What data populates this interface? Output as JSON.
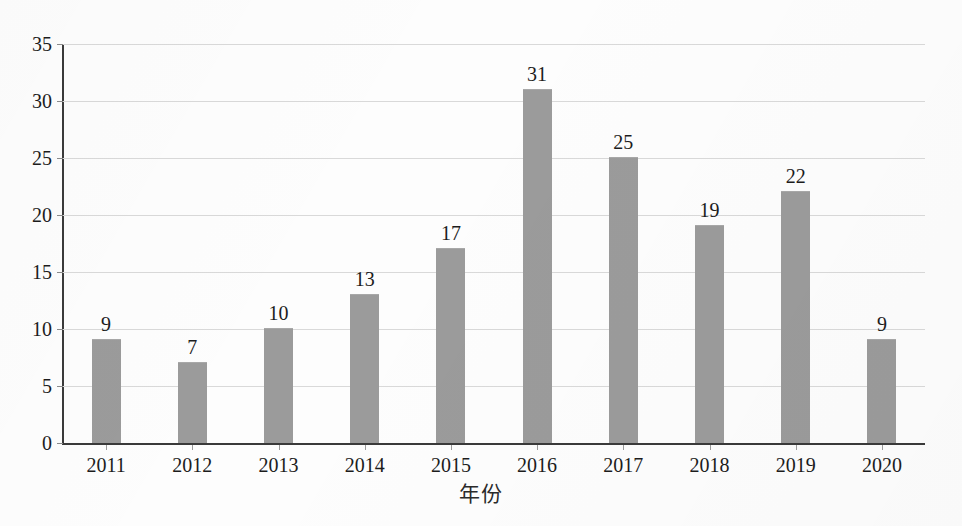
{
  "chart_data": {
    "type": "bar",
    "title": "",
    "subtitle": "",
    "xlabel": "年份",
    "ylabel": "",
    "categories": [
      "2011",
      "2012",
      "2013",
      "2014",
      "2015",
      "2016",
      "2017",
      "2018",
      "2019",
      "2020"
    ],
    "values": [
      9,
      7,
      10,
      13,
      17,
      31,
      25,
      19,
      22,
      9
    ],
    "data_labels": [
      "9",
      "7",
      "10",
      "13",
      "17",
      "31",
      "25",
      "19",
      "22",
      "9"
    ],
    "ylim": [
      0,
      35
    ],
    "ytick_labels": [
      "0",
      "5",
      "10",
      "15",
      "20",
      "25",
      "30",
      "35"
    ],
    "ytick_values": [
      0,
      5,
      10,
      15,
      20,
      25,
      30,
      35
    ],
    "grid": true,
    "grid_axis": "y",
    "legend": false,
    "legend_position": "none",
    "series": [
      {
        "name": "",
        "values": [
          9,
          7,
          10,
          13,
          17,
          31,
          25,
          19,
          22,
          9
        ]
      }
    ]
  },
  "style": {
    "bar_color": "#9b9b9b",
    "axis_color": "#3a3a3a",
    "grid_color": "#d9d9d9",
    "text_color": "#1c1c1c",
    "background": "#fdfdfd"
  }
}
